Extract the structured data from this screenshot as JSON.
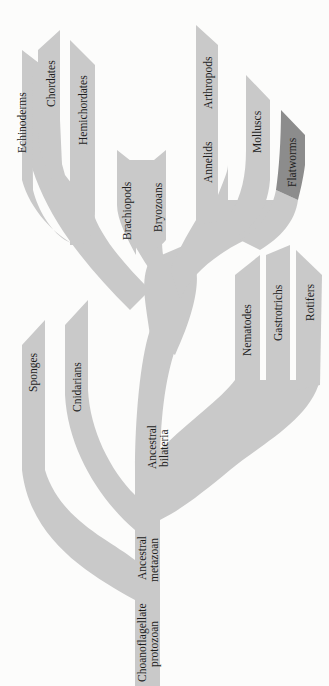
{
  "diagram": {
    "type": "phylogenetic-tree",
    "orientation": "root-bottom, labels rotated -90deg",
    "colors": {
      "background": "#fcfcfb",
      "branch": "#c9c9c9",
      "highlight": "#8c8c8c",
      "text": "#1d1d1d"
    },
    "root": {
      "line1": "Choanoflagellate",
      "line2": "protozoan"
    },
    "nodes": {
      "metazoan": {
        "line1": "Ancestral",
        "line2": "metazoan"
      },
      "bilateria": {
        "line1": "Ancestral",
        "line2": "bilateria"
      }
    },
    "taxa": {
      "sponges": "Sponges",
      "cnidarians": "Cnidarians",
      "nematodes": "Nematodes",
      "gastrotrichs": "Gastrotrichs",
      "rotifers": "Rotifers",
      "brachiopods": "Brachiopods",
      "bryozoans": "Bryozoans",
      "echinoderms": "Echinoderms",
      "chordates": "Chordates",
      "hemichordates": "Hemichordates",
      "annelids": "Annelids",
      "arthropods": "Arthropods",
      "molluscs": "Molluscs",
      "flatworms": "Flatworms"
    },
    "highlighted_taxon": "Flatworms"
  }
}
